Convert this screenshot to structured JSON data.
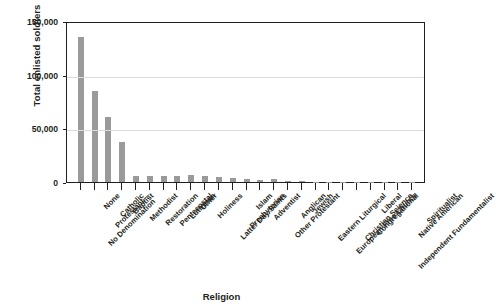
{
  "chart_data": {
    "type": "bar",
    "title": "",
    "xlabel": "Religion",
    "ylabel": "Total enlisted soldiers",
    "ylim": [
      0,
      150000
    ],
    "ytick_values": [
      0,
      50000,
      100000,
      150000
    ],
    "ytick_labels": [
      "0",
      "50,000",
      "100,000",
      "150,000"
    ],
    "grid": "horizontal",
    "legend": "none",
    "bar_color": "#9a9a9a",
    "axis_color": "#231f20",
    "gridline_color": "#dcdcdc",
    "categories": [
      "Protestant—\nNo Denomination",
      "None",
      "Catholic",
      "Baptist",
      "Methodist",
      "Restoration",
      "Pentecostal",
      "Lutheran",
      "Other",
      "Holiness",
      "Latter Day Saints",
      "Presbyterian",
      "Islam",
      "Adventist",
      "Other Protestant",
      "Anglican",
      "Jewish",
      "Eastern Liturgical",
      "European Free Church",
      "Christian Science",
      "Congregational",
      "Liberal",
      "Independent Fundamentalist",
      "Native American",
      "Spiritualist"
    ],
    "values": [
      135000,
      85000,
      61000,
      37000,
      6000,
      6000,
      6000,
      5500,
      6500,
      6000,
      4500,
      3500,
      2500,
      1500,
      3000,
      700,
      500,
      400,
      300,
      250,
      200,
      150,
      120,
      100,
      80
    ]
  }
}
